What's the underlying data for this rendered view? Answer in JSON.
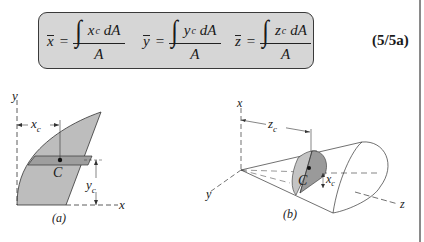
{
  "formula": {
    "equations": [
      {
        "lhs": "x",
        "integrand": "x",
        "subscript": "c",
        "differential": "dA",
        "denominator": "A"
      },
      {
        "lhs": "y",
        "integrand": "y",
        "subscript": "c",
        "differential": "dA",
        "denominator": "A"
      },
      {
        "lhs": "z",
        "integrand": "z",
        "subscript": "c",
        "differential": "dA",
        "denominator": "A"
      }
    ],
    "equals": "=",
    "integral_symbol": "∫",
    "equation_number": "(5/5a)"
  },
  "figure_a": {
    "axis_y_label": "y",
    "axis_x_label": "x",
    "dim_xc": "x",
    "dim_xc_sub": "c",
    "dim_yc": "y",
    "dim_yc_sub": "c",
    "centroid_label": "C",
    "caption": "(a)"
  },
  "figure_b": {
    "axis_x_label": "x",
    "axis_y_label": "y",
    "axis_z_label": "z",
    "dim_zc": "z",
    "dim_zc_sub": "c",
    "dim_xc": "x",
    "dim_xc_sub": "c",
    "centroid_label": "C",
    "caption": "(b)"
  },
  "colors": {
    "box_fill": "#d6d6d6",
    "shape_fill": "#bdbdbd",
    "strip_fill": "#9e9e9e",
    "slice_face": "#9a9a9a",
    "slice_rim": "#c4c4c4",
    "line": "#333333"
  }
}
